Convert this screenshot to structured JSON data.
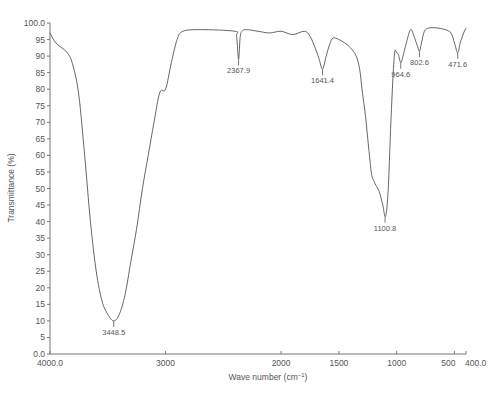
{
  "chart_data": {
    "type": "line",
    "title": "",
    "xlabel": "Wave number (cm⁻¹)",
    "ylabel": "Transmittance (%)",
    "xlim": [
      4000.0,
      400.0
    ],
    "ylim": [
      0.0,
      100.0
    ],
    "x_reversed": true,
    "grid": false,
    "legend": null,
    "x_ticks": [
      {
        "value": 4000,
        "label": "4000.0"
      },
      {
        "value": 3000,
        "label": "3000"
      },
      {
        "value": 2000,
        "label": "2000"
      },
      {
        "value": 1500,
        "label": "1500"
      },
      {
        "value": 1000,
        "label": "1000"
      },
      {
        "value": 500,
        "label": "500"
      },
      {
        "value": 400,
        "label": "400.0"
      }
    ],
    "y_ticks": [
      {
        "value": 0,
        "label": "0.0"
      },
      {
        "value": 5,
        "label": "5"
      },
      {
        "value": 10,
        "label": "10"
      },
      {
        "value": 15,
        "label": "15"
      },
      {
        "value": 20,
        "label": "20"
      },
      {
        "value": 25,
        "label": "25"
      },
      {
        "value": 30,
        "label": "30"
      },
      {
        "value": 35,
        "label": "35"
      },
      {
        "value": 40,
        "label": "40"
      },
      {
        "value": 45,
        "label": "45"
      },
      {
        "value": 50,
        "label": "50"
      },
      {
        "value": 55,
        "label": "55"
      },
      {
        "value": 60,
        "label": "60"
      },
      {
        "value": 65,
        "label": "65"
      },
      {
        "value": 70,
        "label": "70"
      },
      {
        "value": 75,
        "label": "75"
      },
      {
        "value": 80,
        "label": "80"
      },
      {
        "value": 85,
        "label": "85"
      },
      {
        "value": 90,
        "label": "90"
      },
      {
        "value": 95,
        "label": "95"
      },
      {
        "value": 100,
        "label": "100.0"
      }
    ],
    "series": [
      {
        "name": "FTIR spectrum",
        "x": [
          4000,
          3950,
          3850,
          3800,
          3750,
          3700,
          3650,
          3600,
          3550,
          3500,
          3448.5,
          3400,
          3350,
          3300,
          3250,
          3200,
          3150,
          3100,
          3050,
          3000,
          2950,
          2900,
          2850,
          2700,
          2400,
          2385,
          2367.9,
          2355,
          2340,
          2300,
          2200,
          2100,
          2000,
          1900,
          1800,
          1750,
          1700,
          1670,
          1641.4,
          1610,
          1580,
          1550,
          1500,
          1450,
          1400,
          1350,
          1320,
          1300,
          1270,
          1250,
          1220,
          1200,
          1180,
          1150,
          1120,
          1100.8,
          1085,
          1070,
          1050,
          1030,
          1015,
          1000,
          985,
          964.6,
          945,
          920,
          880,
          850,
          820,
          802.6,
          785,
          760,
          720,
          650,
          580,
          530,
          500,
          471.6,
          450,
          420,
          400
        ],
        "y": [
          97,
          94,
          91,
          87,
          78,
          60,
          40,
          25,
          16,
          12,
          10,
          12,
          18,
          28,
          38,
          50,
          60,
          70,
          79,
          80,
          88,
          95,
          97.5,
          98,
          97.5,
          96,
          89,
          95.5,
          97.5,
          98,
          97.5,
          97,
          97.5,
          96.5,
          97.5,
          96,
          92,
          89,
          86,
          90,
          93.5,
          95.5,
          95,
          94,
          92.5,
          90,
          86,
          80,
          72,
          65,
          55,
          52.5,
          51,
          49,
          45,
          41.5,
          44,
          52,
          70,
          85,
          91.5,
          91,
          90.5,
          88,
          90,
          93.5,
          98,
          96,
          93,
          91.5,
          94,
          97.5,
          98.5,
          98.5,
          98,
          97,
          94,
          91,
          94,
          97,
          98.5
        ]
      }
    ],
    "annotations": [
      {
        "x": 3448.5,
        "y": 10,
        "label": "3448.5"
      },
      {
        "x": 2367.9,
        "y": 89,
        "label": "2367.9"
      },
      {
        "x": 1641.4,
        "y": 86,
        "label": "1641.4"
      },
      {
        "x": 1100.8,
        "y": 41.5,
        "label": "1100.8"
      },
      {
        "x": 964.6,
        "y": 88,
        "label": "964.6"
      },
      {
        "x": 802.6,
        "y": 91.5,
        "label": "802.6"
      },
      {
        "x": 471.6,
        "y": 91,
        "label": "471.6"
      }
    ]
  },
  "colors": {
    "curve": "#555555",
    "axis": "#777777",
    "text": "#555555",
    "background": "#ffffff"
  }
}
